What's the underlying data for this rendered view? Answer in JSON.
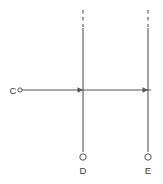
{
  "diagram": {
    "background_color": "#ffffff",
    "stroke_color": "#555555",
    "text_color": "#3a3a3a",
    "points": {
      "c": {
        "label": "C",
        "x": 20,
        "y": 90,
        "marker": "open-circle"
      },
      "d": {
        "label": "D",
        "x": 83,
        "y": 157,
        "marker": "open-circle"
      },
      "e": {
        "label": "E",
        "x": 148,
        "y": 157,
        "marker": "open-circle"
      }
    },
    "ray": {
      "name": "horizontal-ray",
      "from_x": 22,
      "to_x": 151,
      "y": 90,
      "arrowheads_at": [
        83,
        148
      ]
    },
    "vertical_lines": [
      {
        "name": "line-d",
        "x": 83,
        "solid_top_y": 28,
        "bottom_y": 152,
        "dashed_top_y": 10
      },
      {
        "name": "line-e",
        "x": 148,
        "solid_top_y": 28,
        "bottom_y": 152,
        "dashed_top_y": 10
      }
    ]
  }
}
